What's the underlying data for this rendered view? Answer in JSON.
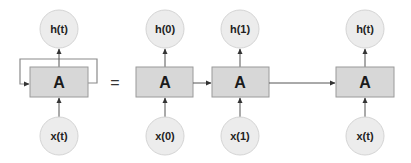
{
  "diagram": {
    "equals_sign": "=",
    "colors": {
      "cell_fill": "#d7d7d7",
      "cell_stroke": "#9a9a9a",
      "node_fill": "#ececec",
      "node_stroke": "#d4d4d4",
      "arrow": "#555555"
    },
    "rolled": {
      "cell_label": "A",
      "output_label": "h(t)",
      "input_label": "x(t)",
      "has_self_loop": true
    },
    "unrolled": [
      {
        "step": "0",
        "cell_label": "A",
        "output_label": "h(0)",
        "input_label": "x(0)"
      },
      {
        "step": "1",
        "cell_label": "A",
        "output_label": "h(1)",
        "input_label": "x(1)"
      },
      {
        "step": "t",
        "cell_label": "A",
        "output_label": "h(t)",
        "input_label": "x(t)"
      }
    ],
    "edges": [
      {
        "from": "x(t)",
        "to": "A (rolled)"
      },
      {
        "from": "A (rolled)",
        "to": "h(t)"
      },
      {
        "from": "A (rolled)",
        "to": "A (rolled)",
        "type": "self-loop"
      },
      {
        "from": "x(0)",
        "to": "A0"
      },
      {
        "from": "A0",
        "to": "h(0)"
      },
      {
        "from": "A0",
        "to": "A1"
      },
      {
        "from": "x(1)",
        "to": "A1"
      },
      {
        "from": "A1",
        "to": "h(1)"
      },
      {
        "from": "A1",
        "to": "At"
      },
      {
        "from": "x(t)",
        "to": "At"
      },
      {
        "from": "At",
        "to": "h(t)"
      }
    ]
  }
}
